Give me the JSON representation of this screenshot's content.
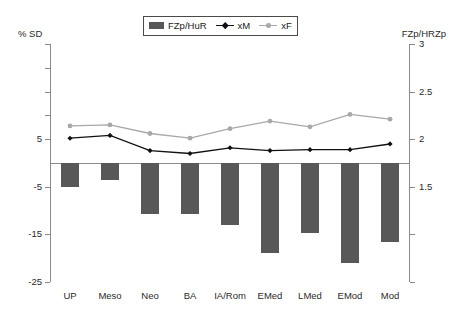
{
  "axes": {
    "left_title": "% SD",
    "right_title": "FZp/HRZp",
    "left_ticks": [
      {
        "value": 25,
        "label": ""
      },
      {
        "value": 20,
        "label": ""
      },
      {
        "value": 15,
        "label": ""
      },
      {
        "value": 10,
        "label": ""
      },
      {
        "value": 5,
        "label": "5"
      },
      {
        "value": -5,
        "label": "-5"
      },
      {
        "value": -15,
        "label": "-15"
      },
      {
        "value": -25,
        "label": "-25"
      }
    ],
    "right_ticks": [
      {
        "value": 3,
        "label": "3"
      },
      {
        "value": 2.5,
        "label": "2.5"
      },
      {
        "value": 2,
        "label": "2"
      },
      {
        "value": 1.5,
        "label": "1.5"
      },
      {
        "value": 1,
        "label": ""
      },
      {
        "value": 0.5,
        "label": ""
      }
    ]
  },
  "legend": {
    "position": "top-center",
    "entries": [
      {
        "label": "FZp/HuR",
        "type": "bar",
        "color": "#585858",
        "icon": "bar-swatch-icon"
      },
      {
        "label": "xM",
        "type": "line",
        "color": "#111111",
        "marker": "diamond",
        "icon": "line-diamond-icon"
      },
      {
        "label": "xF",
        "type": "line",
        "color": "#a8a8a8",
        "marker": "circle",
        "icon": "line-circle-icon"
      }
    ]
  },
  "colors": {
    "bar": "#585858",
    "xM": "#111111",
    "xF": "#a8a8a8",
    "axis": "#8a8a8a",
    "text": "#2a2a2a",
    "background": "#ffffff"
  },
  "chart_data": {
    "type": "bar",
    "title": "",
    "subtitle": "",
    "xlabel": "",
    "ylabel": "% SD",
    "y2label": "FZp/HRZp",
    "grid": false,
    "legend_position": "top-center",
    "categories": [
      "UP",
      "Meso",
      "Neo",
      "BA",
      "IA/Rom",
      "EMed",
      "LMed",
      "EMod",
      "Mod"
    ],
    "ylim": [
      -25,
      25
    ],
    "y2lim": [
      0.5,
      3
    ],
    "series": [
      {
        "name": "FZp/HuR",
        "type": "bar",
        "axis": "left",
        "color": "#585858",
        "values": [
          -5.0,
          -3.5,
          -10.7,
          -10.7,
          -13.0,
          -19.0,
          -14.8,
          -21.0,
          -16.5
        ]
      },
      {
        "name": "xM",
        "type": "line",
        "axis": "right",
        "color": "#111111",
        "marker": "diamond",
        "values": [
          2.01,
          2.04,
          1.88,
          1.85,
          1.91,
          1.88,
          1.89,
          1.89,
          1.95
        ]
      },
      {
        "name": "xF",
        "type": "line",
        "axis": "right",
        "color": "#a8a8a8",
        "marker": "circle",
        "values": [
          2.14,
          2.15,
          2.06,
          2.01,
          2.11,
          2.19,
          2.13,
          2.26,
          2.21
        ]
      }
    ]
  }
}
